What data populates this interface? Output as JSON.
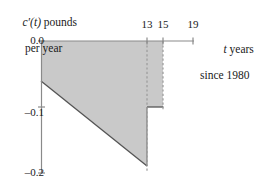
{
  "chart_data": {
    "type": "area",
    "title": "",
    "ylabel_line1": "c′(t) pounds",
    "ylabel_line2": "per year",
    "ylabel_symbol": "c′(t)",
    "ylabel_units": "pounds",
    "xlabel_line1": "t years",
    "xlabel_line2": "since 1980",
    "xlabel_symbol": "t",
    "xlabel_rest": "years",
    "xlim": [
      0,
      19
    ],
    "ylim": [
      -0.2,
      0.0
    ],
    "xticks": [
      13,
      15,
      19
    ],
    "xtick_labels": [
      "13",
      "15",
      "19"
    ],
    "yticks": [
      0.0,
      -0.1,
      -0.2
    ],
    "ytick_labels": [
      "0.0",
      "–0.1",
      "–0.2"
    ],
    "grid": false,
    "legend": "none",
    "fill_color": "#c9c9c9",
    "line_color": "#4d4d4d",
    "axis_color": "#808080",
    "dashed_color": "#999999",
    "series": [
      {
        "name": "c'(t) rate of change",
        "description": "Piecewise rate curve: linear decline from t=0 to t=13, jump up to a constant level from t=13 to t=15, zero after t=15",
        "points": [
          {
            "t": 0,
            "value": -0.06
          },
          {
            "t": 13,
            "value": -0.19
          },
          {
            "t": 13,
            "value": -0.1
          },
          {
            "t": 15,
            "value": -0.1
          },
          {
            "t": 15,
            "value": 0.0
          },
          {
            "t": 19,
            "value": 0.0
          }
        ]
      }
    ],
    "shaded_regions": [
      {
        "name": "region-0-to-13",
        "x_range": [
          0,
          13
        ],
        "top": 0.0,
        "bottom_start": -0.06,
        "bottom_end": -0.19
      },
      {
        "name": "region-13-to-15",
        "x_range": [
          13,
          15
        ],
        "top": 0.0,
        "bottom": -0.1
      }
    ],
    "dashed_verticals": [
      13,
      15
    ],
    "annotations": []
  }
}
